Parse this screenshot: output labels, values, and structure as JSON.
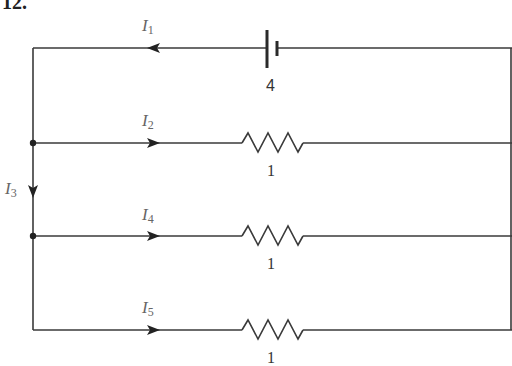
{
  "problem": {
    "number": "12."
  },
  "colors": {
    "wire": "#3a3a3a",
    "label": "#666666",
    "value": "#333333"
  },
  "battery": {
    "label": "4",
    "type": "battery-icon"
  },
  "branches": [
    {
      "id": "top",
      "current": {
        "symbol": "I",
        "index": "1",
        "direction": "left"
      },
      "element": "battery",
      "value": "4"
    },
    {
      "id": "branch-2",
      "current": {
        "symbol": "I",
        "index": "2",
        "direction": "right"
      },
      "element": "resistor",
      "value": "1"
    },
    {
      "id": "branch-4",
      "current": {
        "symbol": "I",
        "index": "4",
        "direction": "right"
      },
      "element": "resistor",
      "value": "1"
    },
    {
      "id": "branch-5",
      "current": {
        "symbol": "I",
        "index": "5",
        "direction": "right"
      },
      "element": "resistor",
      "value": "1"
    }
  ],
  "vertical_current": {
    "symbol": "I",
    "index": "3",
    "direction": "down"
  }
}
